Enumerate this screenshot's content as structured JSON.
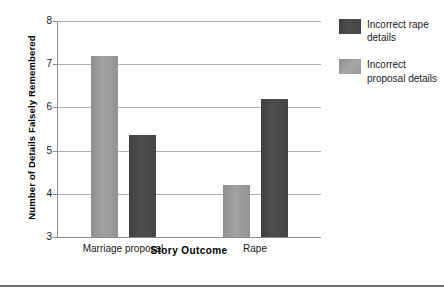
{
  "chart_data": {
    "type": "bar",
    "title": "",
    "xlabel": "Story Outcome",
    "ylabel": "Number of Details Falsely Remembered",
    "categories": [
      "Marriage proposal",
      "Rape"
    ],
    "series": [
      {
        "name": "Incorrect proposal details",
        "color": "#9a9a9a",
        "values": [
          7.2,
          4.2
        ]
      },
      {
        "name": "Incorrect rape details",
        "color": "#4a4a4a",
        "values": [
          5.35,
          6.2
        ]
      }
    ],
    "ylim": [
      3,
      8
    ],
    "yticks": [
      3,
      4,
      5,
      6,
      7,
      8
    ],
    "ytick_labels": [
      "3",
      "4",
      "5",
      "6",
      "7",
      "8"
    ],
    "grid": "horizontal",
    "legend_position": "right"
  },
  "legend": {
    "entries": [
      {
        "label": "Incorrect rape details",
        "color": "#4a4a4a"
      },
      {
        "label": "Incorrect proposal details",
        "color": "#9a9a9a"
      }
    ]
  }
}
